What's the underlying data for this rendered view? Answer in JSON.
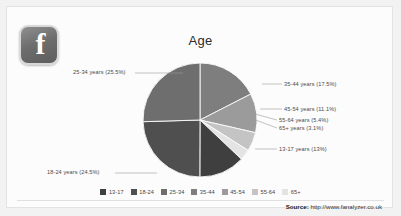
{
  "logo": {
    "name": "facebook-logo",
    "glyph": "f"
  },
  "chart_data": {
    "type": "pie",
    "title": "Age",
    "categories": [
      "13-17",
      "18-24",
      "25-34",
      "35-44",
      "45-54",
      "55-64",
      "65+"
    ],
    "values": [
      13,
      24.5,
      25.5,
      17.5,
      11.1,
      5.4,
      3.1
    ],
    "value_unit": "%",
    "labels": [
      "13-17 years (13%)",
      "18-24 years (24.5%)",
      "25-34 years (25.5%)",
      "35-44 years (17.5%)",
      "45-54 years (11.1%)",
      "55-64 years (5.4%)",
      "65+ years (3.1%)"
    ],
    "colors": [
      "#3f3f3f",
      "#4f4f4f",
      "#6e6e6e",
      "#7e7e7e",
      "#9b9b9b",
      "#c4c4c4",
      "#e4e4e4"
    ],
    "legend_position": "bottom",
    "grid": false,
    "xlabel": "",
    "ylabel": ""
  },
  "footer": {
    "source_key": "Source:",
    "source_url": "http://www.fanalyzer.co.uk"
  }
}
